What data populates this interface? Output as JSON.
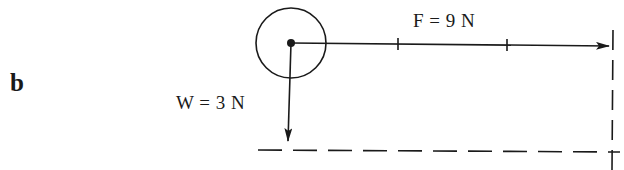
{
  "figure": {
    "part_label": "b",
    "object": {
      "shape": "circle",
      "center": [
        291,
        43
      ],
      "radius": 35
    },
    "vectors": [
      {
        "id": "force",
        "label": "F = 9 N",
        "symbol": "F",
        "magnitude": 9,
        "unit": "N",
        "direction": "right",
        "from": [
          291,
          43
        ],
        "to": [
          610,
          46
        ],
        "tick_marks_x": [
          398,
          507
        ],
        "divisions": 3
      },
      {
        "id": "weight",
        "label": "W = 3 N",
        "symbol": "W",
        "magnitude": 3,
        "unit": "N",
        "direction": "down",
        "from": [
          291,
          43
        ],
        "to": [
          288,
          142
        ]
      }
    ],
    "construction_lines": [
      {
        "id": "dashed-horizontal",
        "style": "dashed",
        "from": [
          258,
          150
        ],
        "to": [
          620,
          152
        ]
      },
      {
        "id": "dashed-vertical",
        "style": "dashed",
        "from": [
          613,
          30
        ],
        "to": [
          612,
          170
        ]
      }
    ],
    "colors": {
      "ink": "#1a1a1a",
      "background": "#ffffff"
    }
  }
}
